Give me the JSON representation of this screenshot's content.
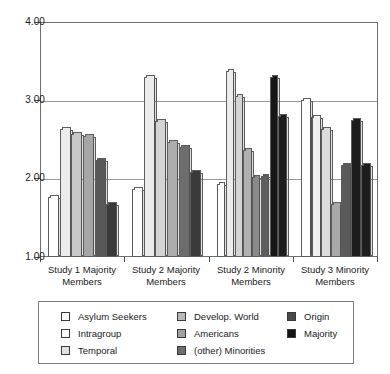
{
  "chart_data": {
    "type": "bar",
    "title": "",
    "subtitle": "",
    "xlabel": "",
    "ylabel": "",
    "ylim": [
      1.0,
      4.0
    ],
    "yticks": [
      "1.00",
      "2.00",
      "3.00",
      "4.00"
    ],
    "ytick_values": [
      1.0,
      2.0,
      3.0,
      4.0
    ],
    "grid": true,
    "legend_position": "bottom",
    "categories": [
      "Study 1 Majority Members",
      "Study 2 Majority Members",
      "Study 2 Minority Members",
      "Study 3 Minority Members"
    ],
    "category_lines": [
      [
        "Study 1 Majority",
        "Members"
      ],
      [
        "Study 2 Majority",
        "Members"
      ],
      [
        "Study 2 Minority",
        "Members"
      ],
      [
        "Study 3 Minority",
        "Members"
      ]
    ],
    "series": [
      {
        "name": "Asylum Seekers",
        "color": "#ffffff",
        "values": [
          1.77,
          1.87,
          1.93,
          null
        ]
      },
      {
        "name": "Intragroup",
        "color": "#fbfbfb",
        "values": [
          null,
          null,
          3.05,
          3.0
        ]
      },
      {
        "name": "Temporal",
        "color": "#e9e9e9",
        "values": [
          2.63,
          3.3,
          3.37,
          2.79
        ]
      },
      {
        "name": "Develop. World",
        "color": "#c6c6c6",
        "values": [
          2.57,
          2.74,
          2.37,
          2.63
        ]
      },
      {
        "name": "Americans",
        "color": "#9a9a9a",
        "values": [
          2.55,
          2.47,
          2.02,
          1.68
        ]
      },
      {
        "name": "(other) Minorities",
        "color": "#6a6a6a",
        "values": [
          1.68,
          2.08,
          2.03,
          2.18
        ]
      },
      {
        "name": "Origin",
        "color": "#4a4a4a",
        "values": [
          2.24,
          2.41,
          3.3,
          2.75
        ]
      },
      {
        "name": "Majority",
        "color": "#111111",
        "values": [
          null,
          null,
          2.8,
          2.17
        ]
      }
    ],
    "bars": [
      {
        "group": 0,
        "series": "Asylum Seekers",
        "value": 1.77,
        "color": "#ffffff"
      },
      {
        "group": 0,
        "series": "Temporal",
        "value": 2.63,
        "color": "#ececec"
      },
      {
        "group": 0,
        "series": "Develop. World",
        "value": 2.57,
        "color": "#c9c9c9"
      },
      {
        "group": 0,
        "series": "Americans",
        "value": 2.55,
        "color": "#a6a6a6"
      },
      {
        "group": 0,
        "series": "Origin",
        "value": 2.24,
        "color": "#585858"
      },
      {
        "group": 0,
        "series": "(other) Minorities",
        "value": 1.68,
        "color": "#3a3a3a"
      },
      {
        "group": 1,
        "series": "Asylum Seekers",
        "value": 1.87,
        "color": "#ffffff"
      },
      {
        "group": 1,
        "series": "Temporal",
        "value": 3.3,
        "color": "#ececec"
      },
      {
        "group": 1,
        "series": "Develop. World",
        "value": 2.74,
        "color": "#d4d4d4"
      },
      {
        "group": 1,
        "series": "Americans",
        "value": 2.47,
        "color": "#adadad"
      },
      {
        "group": 1,
        "series": "Origin",
        "value": 2.41,
        "color": "#6d6d6d"
      },
      {
        "group": 1,
        "series": "(other) Minorities",
        "value": 2.08,
        "color": "#3a3a3a"
      },
      {
        "group": 2,
        "series": "Asylum Seekers",
        "value": 1.93,
        "color": "#ffffff"
      },
      {
        "group": 2,
        "series": "Temporal",
        "value": 3.37,
        "color": "#ececec"
      },
      {
        "group": 2,
        "series": "Intragroup",
        "value": 3.05,
        "color": "#d4d4d4"
      },
      {
        "group": 2,
        "series": "Develop. World",
        "value": 2.37,
        "color": "#b0b0b0"
      },
      {
        "group": 2,
        "series": "Americans",
        "value": 2.02,
        "color": "#8a8a8a"
      },
      {
        "group": 2,
        "series": "(other) Minorities",
        "value": 2.03,
        "color": "#5e5e5e"
      },
      {
        "group": 2,
        "series": "Origin",
        "value": 3.3,
        "color": "#161616"
      },
      {
        "group": 2,
        "series": "Majority",
        "value": 2.8,
        "color": "#1d1d1d"
      },
      {
        "group": 3,
        "series": "Intragroup",
        "value": 3.0,
        "color": "#ffffff"
      },
      {
        "group": 3,
        "series": "Temporal",
        "value": 2.79,
        "color": "#efefef"
      },
      {
        "group": 3,
        "series": "Develop. World",
        "value": 2.63,
        "color": "#dcdcdc"
      },
      {
        "group": 3,
        "series": "Americans",
        "value": 1.68,
        "color": "#a8a8a8"
      },
      {
        "group": 3,
        "series": "Origin",
        "value": 2.18,
        "color": "#5a5a5a"
      },
      {
        "group": 3,
        "series": "Majority2",
        "value": 2.75,
        "color": "#1d1d1d"
      },
      {
        "group": 3,
        "series": "Majority",
        "value": 2.17,
        "color": "#1d1d1d"
      }
    ]
  },
  "legend": {
    "columns": [
      [
        {
          "label": "Asylum Seekers",
          "color": "#ffffff"
        },
        {
          "label": "Intragroup",
          "color": "#fcfcfc"
        },
        {
          "label": "Temporal",
          "color": "#e2e2e2"
        }
      ],
      [
        {
          "label": "Develop. World",
          "color": "#b8b8b8"
        },
        {
          "label": "Americans",
          "color": "#a0a0a0"
        },
        {
          "label": "(other) Minorities",
          "color": "#6e6e6e"
        }
      ],
      [
        {
          "label": "Origin",
          "color": "#4a4a4a"
        },
        {
          "label": "Majority",
          "color": "#141414"
        }
      ]
    ]
  }
}
